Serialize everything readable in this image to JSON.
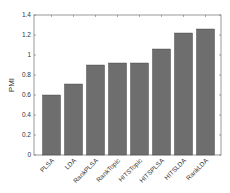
{
  "chart_data": {
    "type": "bar",
    "title": "",
    "xlabel": "",
    "ylabel": "PMI",
    "categories": [
      "PLSA",
      "LDA",
      "RankPLSA",
      "RankTopic",
      "HITSTopic",
      "HITSPLSA",
      "HITSLDA",
      "RankLDA"
    ],
    "values": [
      0.6,
      0.71,
      0.9,
      0.92,
      0.92,
      1.06,
      1.22,
      1.26
    ],
    "ylim": [
      0,
      1.4
    ],
    "yticks": [
      0,
      0.2,
      0.4,
      0.6,
      0.8,
      1,
      1.2,
      1.4
    ],
    "ytick_labels": [
      "0",
      "0.2",
      "0.4",
      "0.6",
      "0.8",
      "1",
      "1.2",
      "1.4"
    ],
    "grid": false,
    "legend": null,
    "bar_color": "#6e6e6e",
    "bar_edge_color": "#3a3a3a",
    "axis_color": "#555555",
    "xtick_rotation": -45
  }
}
